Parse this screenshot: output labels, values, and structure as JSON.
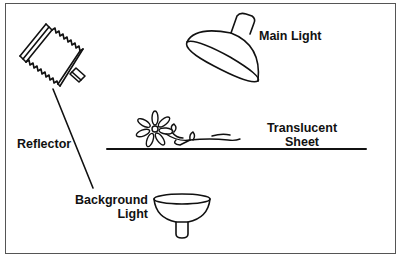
{
  "diagram": {
    "type": "lighting-setup",
    "labels": {
      "main_light": "Main Light",
      "reflector": "Reflector",
      "translucent_sheet_line1": "Translucent",
      "translucent_sheet_line2": "Sheet",
      "background_light_line1": "Background",
      "background_light_line2": "Light"
    },
    "elements": [
      {
        "name": "reflector",
        "shape": "bellows-reflector"
      },
      {
        "name": "main-light",
        "shape": "dome-lamp"
      },
      {
        "name": "flower-subject",
        "shape": "flower-on-stem"
      },
      {
        "name": "translucent-sheet",
        "shape": "horizontal-line"
      },
      {
        "name": "background-light",
        "shape": "bowl-lamp"
      }
    ],
    "colors": {
      "stroke": "#111111",
      "frame": "#555555",
      "background": "#ffffff"
    }
  }
}
